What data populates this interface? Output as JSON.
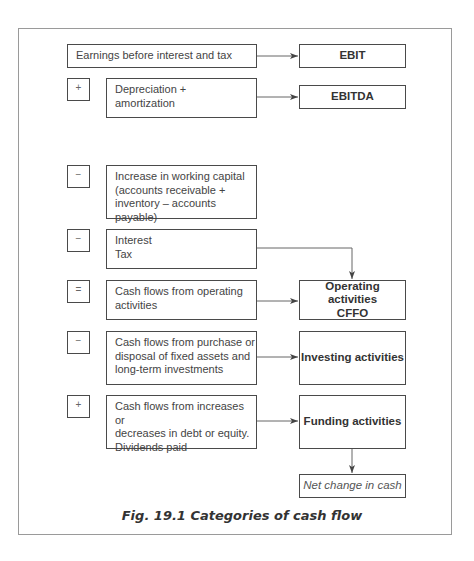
{
  "figure": {
    "caption": "Fig. 19.1  Categories of cash flow"
  },
  "rows": [
    {
      "id": "ebit",
      "sign": "",
      "lines": [
        "Earnings before interest and tax"
      ],
      "result": [
        "EBIT"
      ]
    },
    {
      "id": "ebitda",
      "sign": "+",
      "lines": [
        "Depreciation +",
        "amortization"
      ],
      "result": [
        "EBITDA"
      ]
    },
    {
      "id": "working-capital",
      "sign": "−",
      "lines": [
        "Increase in working capital",
        "(accounts receivable +",
        "inventory – accounts payable)"
      ],
      "result": []
    },
    {
      "id": "interest-tax",
      "sign": "−",
      "lines": [
        "Interest",
        "Tax"
      ],
      "result": []
    },
    {
      "id": "operating",
      "sign": "=",
      "lines": [
        "Cash flows from operating",
        "activities"
      ],
      "result": [
        "Operating activities",
        "CFFO"
      ]
    },
    {
      "id": "investing",
      "sign": "−",
      "lines": [
        "Cash flows from purchase or",
        "disposal of fixed assets and",
        "long-term investments"
      ],
      "result": [
        "Investing activities"
      ]
    },
    {
      "id": "funding",
      "sign": "+",
      "lines": [
        "Cash flows from increases or",
        "decreases in debt or equity.",
        "Dividends paid"
      ],
      "result": [
        "Funding activities"
      ]
    }
  ],
  "final": {
    "label": "Net change in cash"
  },
  "colors": {
    "border": "#4a4a4a",
    "frame": "#9a9a9a",
    "arrow": "#555555",
    "text": "#444444"
  }
}
